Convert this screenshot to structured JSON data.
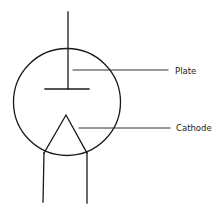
{
  "diagram": {
    "labels": {
      "plate": "Plate",
      "cathode": "Cathode"
    },
    "colors": {
      "stroke": "#1a1a1a",
      "background": "#ffffff"
    }
  }
}
